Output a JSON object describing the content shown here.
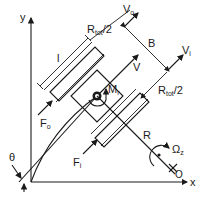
{
  "figure": {
    "axes": {
      "x_label": "x",
      "y_label": "y"
    },
    "labels": {
      "track_length": "l",
      "half_width_outer": {
        "main": "R",
        "sub": "tot",
        "suffix": "/2"
      },
      "half_width_inner": {
        "main": "R",
        "sub": "tot",
        "suffix": "/2"
      },
      "outer_velocity": {
        "main": "V",
        "sub": "o"
      },
      "inner_velocity": {
        "main": "V",
        "sub": "i"
      },
      "track_spacing": "B",
      "velocity": "V",
      "moment": {
        "main": "M",
        "sub": "r"
      },
      "outer_force": {
        "main": "F",
        "sub": "o"
      },
      "inner_force": {
        "main": "F",
        "sub": "i"
      },
      "turn_radius": "R",
      "yaw_rate": {
        "main": "Ω",
        "sub": "z"
      },
      "center": {
        "main": "",
        "sub": "O"
      },
      "heading_angle": "θ"
    },
    "colors": {
      "ink": "#1a1a1a",
      "background": "#ffffff"
    }
  }
}
